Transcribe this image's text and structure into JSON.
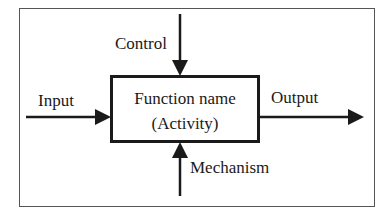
{
  "diagram": {
    "type": "IDEF0 function block",
    "function_box": {
      "line1": "Function name",
      "line2": "(Activity)"
    },
    "arrows": {
      "control": "Control",
      "input": "Input",
      "output": "Output",
      "mechanism": "Mechanism"
    },
    "colors": {
      "stroke": "#1a1a1a",
      "frame": "#555555",
      "background": "#ffffff"
    }
  }
}
